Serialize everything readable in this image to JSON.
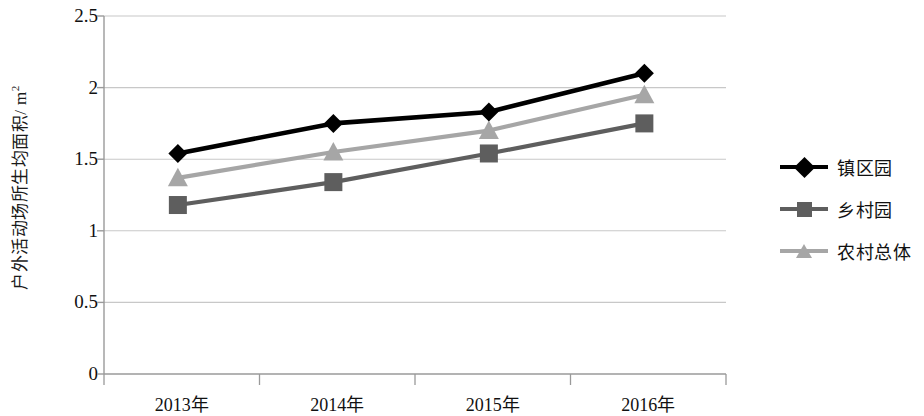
{
  "chart_data": {
    "type": "line",
    "title": "",
    "xlabel": "",
    "ylabel": "户外活动场所生均面积/m²",
    "ylabel_text": "户外活动场所生均面积/ m",
    "ylabel_sup": "2",
    "categories": [
      "2013年",
      "2014年",
      "2015年",
      "2016年"
    ],
    "ylim": [
      0,
      2.5
    ],
    "ytick_labels": [
      "0",
      "0.5",
      "1",
      "1.5",
      "2",
      "2.5"
    ],
    "ytick_values": [
      0,
      0.5,
      1,
      1.5,
      2,
      2.5
    ],
    "grid": true,
    "legend_position": "right",
    "series": [
      {
        "name": "镇区园",
        "values": [
          1.54,
          1.75,
          1.83,
          2.1
        ],
        "color": "#000000",
        "marker": "diamond"
      },
      {
        "name": "乡村园",
        "values": [
          1.18,
          1.34,
          1.54,
          1.75
        ],
        "color": "#5e5e5e",
        "marker": "square"
      },
      {
        "name": "农村总体",
        "values": [
          1.37,
          1.55,
          1.7,
          1.95
        ],
        "color": "#a6a6a6",
        "marker": "triangle"
      }
    ]
  },
  "axis": {
    "line_color": "#9a9a9a",
    "grid_color": "#c8c8c8"
  }
}
